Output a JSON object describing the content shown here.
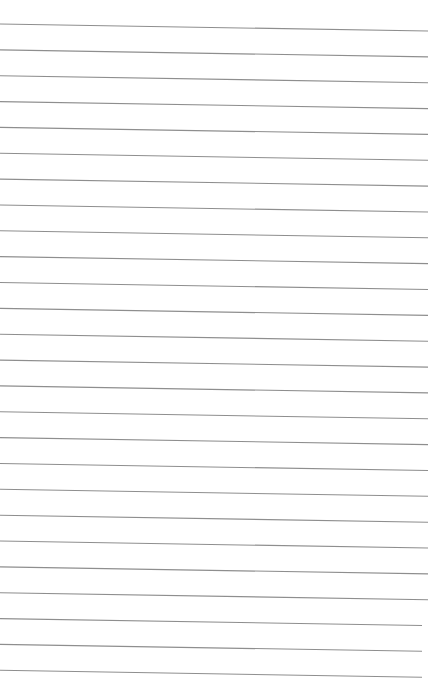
{
  "page": {
    "type": "lined-paper",
    "background": "#ffffff",
    "line_color": "#8e8e8e",
    "line_count": 26,
    "first_line_y_left": 24,
    "first_line_y_right": 31,
    "line_spacing": 25.85,
    "line_start_x": 0,
    "line_end_x": 428,
    "text_content": []
  }
}
